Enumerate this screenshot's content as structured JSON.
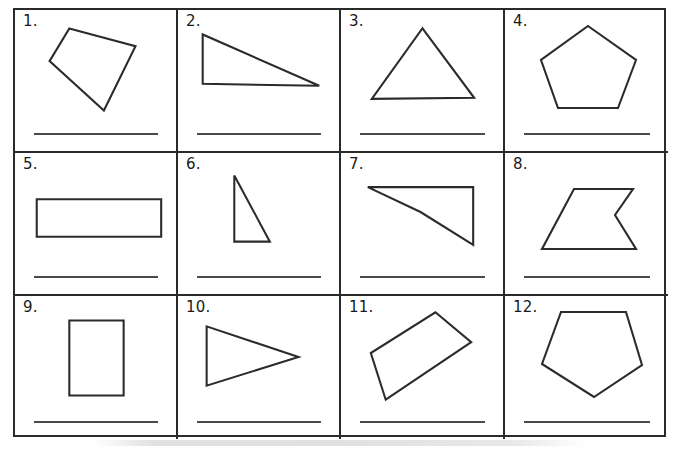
{
  "worksheet": {
    "title": "Polygon identification worksheet",
    "columns": 4,
    "rows": 3,
    "ink_color": "#2b2b2b",
    "line_color": "#4a4a4a",
    "background": "#ffffff",
    "answer_line_placeholder": ""
  },
  "cells": [
    {
      "number": "1.",
      "shape_name": "quadrilateral-tilted",
      "sides": 4,
      "points": "55,12 122,30 90,95 35,45",
      "answer": ""
    },
    {
      "number": "2.",
      "shape_name": "right-triangle-wide",
      "sides": 3,
      "points": "25,18 25,68 143,70",
      "answer": ""
    },
    {
      "number": "3.",
      "shape_name": "isosceles-triangle",
      "sides": 3,
      "points": "82,12 134,82 31,83",
      "answer": ""
    },
    {
      "number": "4.",
      "shape_name": "regular-pentagon",
      "sides": 5,
      "points": "83,10 131,44 113,92 53,92 36,44",
      "answer": ""
    },
    {
      "number": "5.",
      "shape_name": "wide-rectangle",
      "sides": 4,
      "points": "22,40 148,40 148,78 22,78",
      "answer": ""
    },
    {
      "number": "6.",
      "shape_name": "tall-right-triangle",
      "sides": 3,
      "points": "57,16 57,83 93,83",
      "answer": ""
    },
    {
      "number": "7.",
      "shape_name": "concave-quadrilateral-chevron",
      "sides": 4,
      "points": "27,28 133,28 133,86 80,53",
      "answer": ""
    },
    {
      "number": "8.",
      "shape_name": "concave-pentagon-notch",
      "sides": 5,
      "points": "69,30 128,30 110,56 131,90 37,90",
      "answer": ""
    },
    {
      "number": "9.",
      "shape_name": "tall-rectangle",
      "sides": 4,
      "points": "55,18 110,18 110,94 55,94",
      "answer": ""
    },
    {
      "number": "10.",
      "shape_name": "right-pointing-triangle",
      "sides": 3,
      "points": "29,24 122,55 29,84",
      "answer": ""
    },
    {
      "number": "11.",
      "shape_name": "rotated-quadrilateral",
      "sides": 4,
      "points": "95,10 131,40 45,98 30,51",
      "answer": ""
    },
    {
      "number": "12.",
      "shape_name": "inverted-pentagon",
      "sides": 5,
      "points": "56,10 121,10 137,63 89,95 37,62",
      "answer": ""
    }
  ]
}
